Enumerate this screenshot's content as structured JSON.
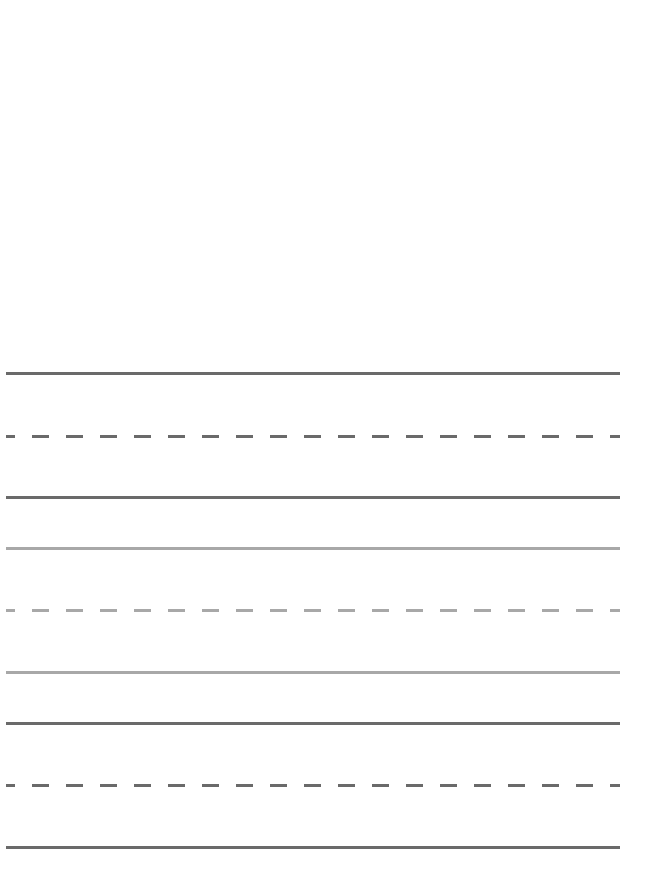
{
  "page": {
    "type": "handwriting-practice-sheet",
    "background": "#ffffff"
  },
  "line_groups": [
    {
      "name": "group-1",
      "color": "#6a6a6a",
      "top_line_y": 372,
      "mid_line_y": 435,
      "base_line_y": 496
    },
    {
      "name": "group-2",
      "color": "#a8a8a8",
      "top_line_y": 547,
      "mid_line_y": 609,
      "base_line_y": 671
    },
    {
      "name": "group-3",
      "color": "#6a6a6a",
      "top_line_y": 722,
      "mid_line_y": 784,
      "base_line_y": 846
    }
  ]
}
